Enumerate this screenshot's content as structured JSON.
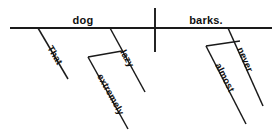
{
  "diagram": {
    "kind": "reed-kellogg-sentence-diagram",
    "canvas": {
      "width": 280,
      "height": 133,
      "background": "#ffffff"
    },
    "ink_color": "#1a1a1a",
    "sentence": "That extremely lazy dog almost never barks.",
    "baseline": {
      "x1": 10,
      "y1": 28,
      "x2": 272,
      "y2": 28
    },
    "divider": {
      "x1": 155,
      "y1": 8,
      "x2": 155,
      "y2": 52
    },
    "subject": {
      "label": "dog",
      "x": 83,
      "y": 24
    },
    "predicate": {
      "label": "barks.",
      "x": 206,
      "y": 24
    },
    "modifiers": [
      {
        "label": "That",
        "attaches_to": "dog",
        "line": {
          "x1": 38,
          "y1": 28,
          "x2": 68,
          "y2": 79
        },
        "text": {
          "x": 47,
          "y": 48,
          "rotate": 59
        }
      },
      {
        "label": "lazy",
        "attaches_to": "dog",
        "line": {
          "x1": 110,
          "y1": 28,
          "x2": 145,
          "y2": 92
        },
        "text": {
          "x": 120,
          "y": 52,
          "rotate": 61
        }
      },
      {
        "label": "extremely",
        "attaches_to": "lazy",
        "connector": {
          "x1": 122,
          "y1": 51,
          "x2": 88,
          "y2": 57
        },
        "line": {
          "x1": 88,
          "y1": 57,
          "x2": 128,
          "y2": 129
        },
        "text": {
          "x": 97,
          "y": 76,
          "rotate": 61
        }
      },
      {
        "label": "never",
        "attaches_to": "barks.",
        "line": {
          "x1": 228,
          "y1": 28,
          "x2": 263,
          "y2": 106
        },
        "text": {
          "x": 237,
          "y": 49,
          "rotate": 66
        }
      },
      {
        "label": "almost",
        "attaches_to": "never",
        "connector": {
          "x1": 240,
          "y1": 41,
          "x2": 206,
          "y2": 46
        },
        "line": {
          "x1": 206,
          "y1": 46,
          "x2": 246,
          "y2": 124
        },
        "text": {
          "x": 215,
          "y": 65,
          "rotate": 63
        }
      }
    ]
  }
}
